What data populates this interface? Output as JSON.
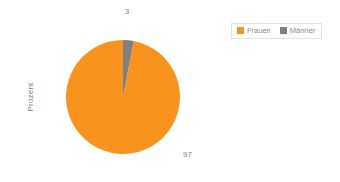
{
  "chart_data": {
    "type": "pie",
    "title": "",
    "xlabel": "",
    "ylabel": "Prozent",
    "grid": false,
    "legend_position": "top-right",
    "categories": [
      "Frauen",
      "Männer"
    ],
    "values": [
      97,
      3
    ],
    "unit": "Prozent",
    "series": [
      {
        "name": "Frauen",
        "value": 97,
        "color": "#f8941e",
        "label": "97"
      },
      {
        "name": "Männer",
        "value": 3,
        "color": "#808080",
        "label": "3"
      }
    ],
    "start_angle_deg": 0,
    "direction": "counterclockwise-major"
  },
  "axis": {
    "y_label": "Prozent"
  },
  "labels": {
    "frauen_value": "97",
    "maenner_value": "3"
  },
  "legend": {
    "items": [
      {
        "label": "Frauen",
        "color": "#f8941e"
      },
      {
        "label": "Männer",
        "color": "#808080"
      }
    ]
  },
  "colors": {
    "frauen": "#f8941e",
    "maenner": "#808080",
    "text": "#808080",
    "legend_border": "#e2e2e2",
    "background": "#ffffff"
  }
}
